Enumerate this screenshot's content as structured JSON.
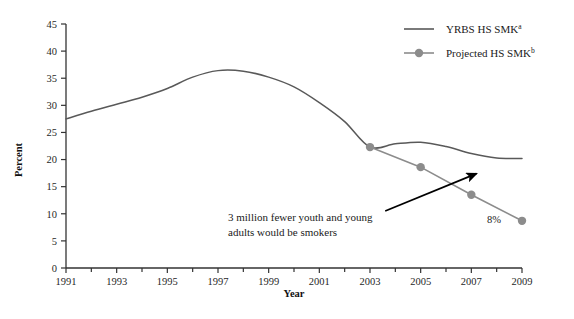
{
  "chart_data": {
    "type": "line",
    "title": "",
    "xlabel": "Year",
    "ylabel": "Percent",
    "xlim": [
      1991,
      2009
    ],
    "ylim": [
      0,
      45
    ],
    "ytick_step": 5,
    "xtick_step": 2,
    "grid": false,
    "legend_position": "top-right",
    "ytick_labels": [
      "0",
      "5",
      "10",
      "15",
      "20",
      "25",
      "30",
      "35",
      "40",
      "45"
    ],
    "ytick_values": [
      0,
      5,
      10,
      15,
      20,
      25,
      30,
      35,
      40,
      45
    ],
    "xtick_labels": [
      "1991",
      "1993",
      "1995",
      "1997",
      "1999",
      "2001",
      "2003",
      "2005",
      "2007",
      "2009"
    ],
    "xtick_values": [
      1991,
      1993,
      1995,
      1997,
      1999,
      2001,
      2003,
      2005,
      2007,
      2009
    ],
    "series": [
      {
        "name": "YRBS HS SMK",
        "footnote": "a",
        "color": "#595959",
        "marker": "none",
        "x": [
          1991,
          1992,
          1993,
          1994,
          1995,
          1996,
          1997,
          1998,
          1999,
          2000,
          2001,
          2002,
          2003,
          2004,
          2005,
          2006,
          2007,
          2008,
          2009
        ],
        "values": [
          27.5,
          28.9,
          30.2,
          31.5,
          33.1,
          35.2,
          36.4,
          36.3,
          35.2,
          33.4,
          30.5,
          27.0,
          22.3,
          22.9,
          23.2,
          22.4,
          21.1,
          20.3,
          20.2
        ]
      },
      {
        "name": "Projected HS SMK",
        "footnote": "b",
        "color": "#8c8c8c",
        "marker": "circle",
        "x": [
          2003,
          2005,
          2007,
          2009
        ],
        "values": [
          22.3,
          18.6,
          13.5,
          8.7
        ]
      }
    ],
    "annotations": [
      {
        "name": "gap-annotation",
        "line1": "3 million fewer youth and young",
        "line2": "adults would be smokers",
        "arrow": {
          "from_x": 2003.6,
          "from_y": 10.5,
          "to_x": 2007.2,
          "to_y": 17.4
        }
      },
      {
        "name": "endpoint-value-label",
        "text": "8%",
        "at_x": 2009,
        "at_y": 8.7
      }
    ]
  },
  "legend": {
    "items": [
      {
        "label": "YRBS HS SMK",
        "sup": "a",
        "color": "#595959",
        "marker": "none"
      },
      {
        "label": "Projected HS SMK",
        "sup": "b",
        "color": "#8c8c8c",
        "marker": "circle"
      }
    ]
  },
  "axes": {
    "x_title": "Year",
    "y_title": "Percent"
  },
  "colors": {
    "background": "#ffffff",
    "axis": "#333333",
    "text": "#1a1a1a",
    "series_yrbs": "#595959",
    "series_projected": "#8c8c8c",
    "arrow": "#000000"
  }
}
